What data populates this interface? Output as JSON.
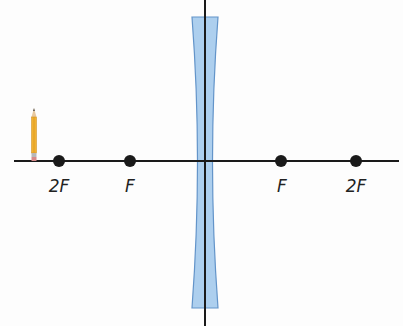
{
  "diagram": {
    "type": "optics-ray-diagram",
    "lens": {
      "kind": "concave (diverging) lens",
      "fill": "#a9cdee",
      "stroke": "#5b8fc7"
    },
    "axis_color": "#1a1a1a",
    "point_color": "#1a1a1a",
    "object": {
      "kind": "pencil",
      "position_label": "beyond 2F"
    },
    "points": [
      {
        "label": "2F",
        "side": "left"
      },
      {
        "label": "F",
        "side": "left"
      },
      {
        "label": "F",
        "side": "right"
      },
      {
        "label": "2F",
        "side": "right"
      }
    ]
  }
}
